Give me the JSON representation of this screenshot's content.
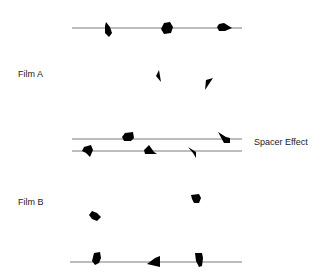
{
  "diagram": {
    "labels": {
      "film_a": "Film A",
      "film_b": "Film B",
      "spacer_effect": "Spacer Effect"
    },
    "colors": {
      "line": "#7a7a7a",
      "particle": "#000000",
      "text": "#222222",
      "background": "#ffffff"
    },
    "rows": [
      {
        "name": "top-line",
        "y": 28,
        "x1": 72,
        "x2": 242,
        "particles": 3
      },
      {
        "name": "film-a-free-particles",
        "particles": 2
      },
      {
        "name": "spacer-line-upper",
        "y": 139,
        "x1": 72,
        "x2": 242,
        "particles": 2
      },
      {
        "name": "spacer-line-lower",
        "y": 151,
        "x1": 72,
        "x2": 242,
        "particles": 3
      },
      {
        "name": "film-b-free-particles",
        "particles": 2
      },
      {
        "name": "bottom-line",
        "y": 262,
        "x1": 70,
        "x2": 242,
        "particles": 3
      }
    ]
  }
}
